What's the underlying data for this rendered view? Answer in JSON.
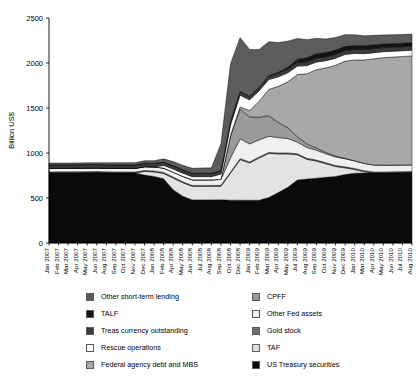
{
  "chart_data": {
    "type": "area",
    "title": "",
    "xlabel": "",
    "ylabel": "Billion US$",
    "ylim": [
      0,
      2500
    ],
    "yticks": [
      0,
      500,
      1000,
      1500,
      2000,
      2500
    ],
    "grid": false,
    "stacked": true,
    "legend_position": "bottom",
    "legend_columns": 2,
    "categories": [
      "Jan 2007",
      "Feb 2007",
      "Mar 2007",
      "Apr 2007",
      "May 2007",
      "Jun 2007",
      "Aug 2007",
      "Sep 2007",
      "Oct 2007",
      "Nov 2007",
      "Dec 2007",
      "Jan 2008",
      "Feb 2008",
      "Apr 2008",
      "May 2008",
      "Jun 2008",
      "Jul 2008",
      "Aug 2008",
      "Sep 2008",
      "Oct 2008",
      "Dec 2008",
      "Jan 2009",
      "Feb 2009",
      "Mar 2009",
      "Apr 2009",
      "May 2009",
      "Jul 2009",
      "Aug 2009",
      "Sep 2009",
      "Oct 2009",
      "Nov 2009",
      "Dec 2009",
      "Jan 2010",
      "Mar 2010",
      "Apr 2010",
      "May 2010",
      "Jun 2010",
      "Jul 2010",
      "Aug 2010"
    ],
    "series": [
      {
        "name": "US Treasury securities",
        "color": "#0a0a0a",
        "values": [
          779,
          780,
          780,
          781,
          782,
          783,
          780,
          779,
          779,
          778,
          755,
          740,
          713,
          591,
          520,
          479,
          479,
          479,
          480,
          476,
          476,
          475,
          475,
          505,
          560,
          620,
          700,
          710,
          720,
          730,
          740,
          760,
          776,
          778,
          778,
          778,
          780,
          782,
          784
        ]
      },
      {
        "name": "TAF",
        "color": "#e3e3e3",
        "values": [
          0,
          0,
          0,
          0,
          0,
          0,
          0,
          0,
          0,
          0,
          40,
          50,
          60,
          130,
          150,
          150,
          150,
          150,
          150,
          300,
          450,
          415,
          470,
          490,
          430,
          370,
          280,
          220,
          190,
          150,
          110,
          75,
          40,
          15,
          0,
          0,
          0,
          0,
          0
        ]
      },
      {
        "name": "Gold stock",
        "color": "#6e6e6e",
        "values": [
          11,
          11,
          11,
          11,
          11,
          11,
          11,
          11,
          11,
          11,
          11,
          11,
          11,
          11,
          11,
          11,
          11,
          11,
          11,
          11,
          11,
          11,
          11,
          11,
          11,
          11,
          11,
          11,
          11,
          11,
          11,
          11,
          11,
          11,
          11,
          11,
          11,
          11,
          11
        ]
      },
      {
        "name": "Other Fed assets",
        "color": "#f0f0f0",
        "values": [
          40,
          40,
          40,
          40,
          40,
          40,
          40,
          40,
          40,
          40,
          42,
          45,
          48,
          55,
          60,
          62,
          62,
          62,
          65,
          160,
          220,
          200,
          190,
          180,
          170,
          160,
          130,
          120,
          110,
          100,
          95,
          90,
          85,
          80,
          78,
          76,
          75,
          74,
          74
        ]
      },
      {
        "name": "CPFF",
        "color": "#9a9a9a",
        "values": [
          0,
          0,
          0,
          0,
          0,
          0,
          0,
          0,
          0,
          0,
          0,
          0,
          0,
          0,
          0,
          0,
          0,
          0,
          0,
          240,
          330,
          300,
          250,
          230,
          170,
          120,
          60,
          40,
          25,
          15,
          10,
          5,
          2,
          0,
          0,
          0,
          0,
          0,
          0
        ]
      },
      {
        "name": "Federal agency debt and MBS",
        "color": "#a8a8a8",
        "values": [
          0,
          0,
          0,
          0,
          0,
          0,
          0,
          0,
          0,
          0,
          0,
          0,
          0,
          0,
          0,
          0,
          0,
          0,
          0,
          10,
          25,
          70,
          180,
          290,
          400,
          510,
          690,
          780,
          870,
          940,
          1010,
          1080,
          1120,
          1150,
          1180,
          1195,
          1200,
          1205,
          1210
        ]
      },
      {
        "name": "Rescue operations",
        "color": "#ffffff",
        "values": [
          0,
          0,
          0,
          0,
          0,
          0,
          0,
          0,
          0,
          0,
          0,
          0,
          30,
          35,
          35,
          35,
          35,
          35,
          60,
          115,
          130,
          120,
          115,
          110,
          105,
          100,
          95,
          90,
          85,
          80,
          78,
          75,
          72,
          70,
          68,
          66,
          65,
          64,
          64
        ]
      },
      {
        "name": "Treas currency outstanding",
        "color": "#3b3b3b",
        "values": [
          38,
          38,
          38,
          38,
          38,
          38,
          38,
          38,
          38,
          38,
          38,
          38,
          38,
          38,
          38,
          38,
          38,
          38,
          38,
          38,
          40,
          40,
          40,
          41,
          41,
          42,
          42,
          43,
          43,
          43,
          44,
          44,
          44,
          45,
          45,
          45,
          45,
          45,
          45
        ]
      },
      {
        "name": "TALF",
        "color": "#141414",
        "values": [
          0,
          0,
          0,
          0,
          0,
          0,
          0,
          0,
          0,
          0,
          0,
          0,
          0,
          0,
          0,
          0,
          0,
          0,
          0,
          0,
          0,
          0,
          0,
          0,
          10,
          20,
          35,
          45,
          50,
          48,
          46,
          45,
          44,
          43,
          42,
          41,
          40,
          39,
          38
        ]
      },
      {
        "name": "Other short-term lending",
        "color": "#5c5c5c",
        "values": [
          20,
          20,
          20,
          20,
          20,
          20,
          22,
          25,
          25,
          25,
          28,
          30,
          35,
          45,
          50,
          55,
          58,
          60,
          300,
          640,
          600,
          520,
          420,
          380,
          330,
          290,
          230,
          200,
          170,
          150,
          140,
          130,
          120,
          110,
          105,
          100,
          98,
          96,
          95
        ]
      }
    ]
  },
  "legend": {
    "left_column": [
      {
        "label": "Other short-term lending",
        "color": "#5c5c5c"
      },
      {
        "label": "TALF",
        "color": "#141414"
      },
      {
        "label": "Treas currency outstanding",
        "color": "#3b3b3b"
      },
      {
        "label": "Rescue operations",
        "color": "#ffffff"
      },
      {
        "label": "Federal agency debt and MBS",
        "color": "#a8a8a8"
      }
    ],
    "right_column": [
      {
        "label": "CPFF",
        "color": "#9a9a9a"
      },
      {
        "label": "Other Fed assets",
        "color": "#f0f0f0"
      },
      {
        "label": "Gold stock",
        "color": "#6e6e6e"
      },
      {
        "label": "TAF",
        "color": "#e3e3e3"
      },
      {
        "label": "US Treasury securities",
        "color": "#0a0a0a"
      }
    ]
  }
}
